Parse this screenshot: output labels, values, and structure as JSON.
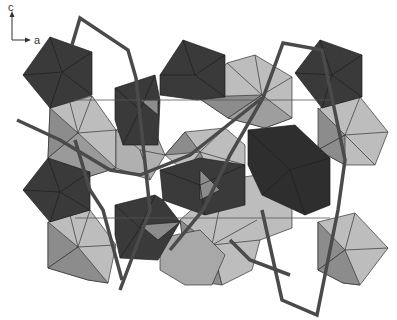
{
  "figure": {
    "type": "crystal-structure-polyhedral-projection",
    "axes": {
      "vertical_label": "c",
      "horizontal_label": "a"
    },
    "colors": {
      "background": "#ffffff",
      "dark_polyhedron": "#3a3a3a",
      "dark_polyhedron_face2": "#2e2e2e",
      "light_polyhedron": "#bdbdbd",
      "mid_polyhedron": "#8c8c8c",
      "bond_chain": "#4a4a4a",
      "edge": "#222222"
    }
  }
}
